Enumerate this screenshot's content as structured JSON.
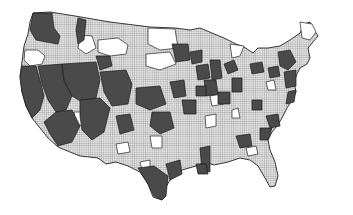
{
  "map": {
    "subject": "Contiguous United States divided into regions",
    "legend_categories": [
      {
        "name": "dark",
        "color": "#4a4a4a"
      },
      {
        "name": "crosshatch",
        "color": "#c8c8c8"
      },
      {
        "name": "white",
        "color": "#ffffff"
      }
    ],
    "colors": {
      "background": "#ffffff",
      "dark": "#4a4a4a",
      "hatch_bg": "#e2e2e2",
      "hatch_line": "#8a8a8a",
      "light": "#ffffff",
      "border": "#222222"
    }
  }
}
